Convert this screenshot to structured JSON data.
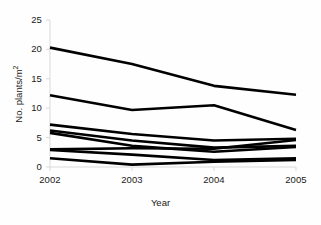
{
  "chart_data": {
    "type": "line",
    "title": "",
    "xlabel": "Year",
    "ylabel_text": "No. plants/m",
    "ylabel_sup": "2",
    "ylabel_full": "No. plants/m2",
    "x": [
      2002,
      2003,
      2004,
      2005
    ],
    "xticklabels": [
      "2002",
      "2003",
      "2004",
      "2005"
    ],
    "yticklabels": [
      "0",
      "5",
      "10",
      "15",
      "20",
      "25"
    ],
    "yticks": [
      0,
      5,
      10,
      15,
      20,
      25
    ],
    "xlim": [
      2002,
      2005
    ],
    "ylim": [
      0,
      25
    ],
    "grid": false,
    "legend": false,
    "legend_position": "none",
    "line_color": "#000000",
    "axis_color": "#d9d9d9",
    "series": [
      {
        "name": "series-1",
        "values": [
          20.3,
          17.5,
          13.8,
          12.3
        ]
      },
      {
        "name": "series-2",
        "values": [
          12.2,
          9.7,
          10.5,
          6.3
        ]
      },
      {
        "name": "series-3",
        "values": [
          7.2,
          5.6,
          4.5,
          4.8
        ]
      },
      {
        "name": "series-4",
        "values": [
          6.2,
          4.5,
          3.3,
          3.6
        ]
      },
      {
        "name": "series-5",
        "values": [
          5.8,
          3.6,
          2.6,
          3.4
        ]
      },
      {
        "name": "series-6",
        "values": [
          3.0,
          3.2,
          3.1,
          4.6
        ]
      },
      {
        "name": "series-7",
        "values": [
          2.9,
          2.1,
          1.2,
          1.5
        ]
      },
      {
        "name": "series-8",
        "values": [
          1.5,
          0.4,
          0.9,
          1.2
        ]
      }
    ]
  },
  "axes": {
    "x_tick_labels": [
      "2002",
      "2003",
      "2004",
      "2005"
    ],
    "y_tick_labels": [
      "25",
      "20",
      "15",
      "10",
      "5",
      "0"
    ],
    "x_axis_title": "Year",
    "y_axis_title": "No. plants/m",
    "y_axis_title_superscript": "2"
  }
}
